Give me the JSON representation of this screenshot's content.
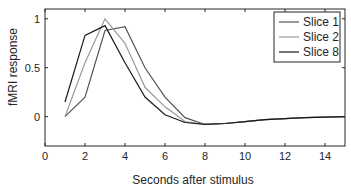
{
  "chart_data": {
    "type": "line",
    "title": "",
    "xlabel": "Seconds after stimulus",
    "ylabel": "fMRI response",
    "xlim": [
      0,
      15
    ],
    "ylim": [
      -0.3,
      1.1
    ],
    "xticks": [
      0,
      2,
      4,
      6,
      8,
      10,
      12,
      14
    ],
    "yticks": [
      0,
      0.5,
      1
    ],
    "xtick_labels": [
      "0",
      "2",
      "4",
      "6",
      "8",
      "10",
      "12",
      "14"
    ],
    "ytick_labels": [
      "0",
      "0.5",
      "1"
    ],
    "grid": false,
    "legend_position": "upper right",
    "x": [
      1,
      2,
      3,
      4,
      5,
      6,
      7,
      8,
      9,
      10,
      11,
      12,
      13,
      14,
      15
    ],
    "series": [
      {
        "name": "Slice 1",
        "color": "#555555",
        "values": [
          0.0,
          0.2,
          0.88,
          0.92,
          0.5,
          0.2,
          -0.01,
          -0.08,
          -0.07,
          -0.05,
          -0.03,
          -0.02,
          -0.01,
          -0.005,
          0.0
        ]
      },
      {
        "name": "Slice 2",
        "color": "#999999",
        "values": [
          0.0,
          0.55,
          1.0,
          0.75,
          0.3,
          0.1,
          -0.05,
          -0.08,
          -0.07,
          -0.05,
          -0.03,
          -0.02,
          -0.01,
          -0.005,
          0.0
        ]
      },
      {
        "name": "Slice 8",
        "color": "#1a1a1a",
        "values": [
          0.15,
          0.83,
          0.93,
          0.55,
          0.2,
          0.02,
          -0.06,
          -0.08,
          -0.07,
          -0.05,
          -0.03,
          -0.02,
          -0.01,
          -0.005,
          0.0
        ]
      }
    ]
  },
  "legend": {
    "items": [
      "Slice 1",
      "Slice 2",
      "Slice 8"
    ]
  }
}
